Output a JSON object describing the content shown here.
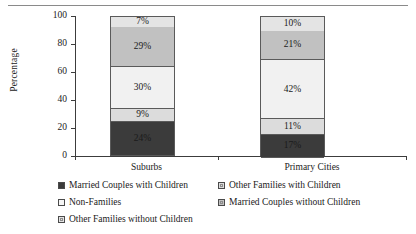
{
  "chart_data": {
    "type": "bar",
    "stacked": true,
    "stack_mode": "percent",
    "title": "",
    "subtitle": "",
    "xlabel": "",
    "ylabel": "Percentage",
    "categories": [
      "Suburbs",
      "Primary Cities"
    ],
    "ylim": [
      0,
      100
    ],
    "yticks": [
      0,
      20,
      40,
      60,
      80,
      100
    ],
    "ytick_labels": [
      "0",
      "20",
      "40",
      "60",
      "80",
      "100"
    ],
    "grid": false,
    "legend_position": "bottom",
    "series": [
      {
        "name": "Married Couples with Children",
        "color": "#3b3b3b",
        "values": [
          24,
          17
        ],
        "labels": [
          "24%",
          "17%"
        ]
      },
      {
        "name": "Other Families with Children",
        "color": "#dcdcdc",
        "values": [
          9,
          11
        ],
        "labels": [
          "9%",
          "11%"
        ]
      },
      {
        "name": "Non-Families",
        "color": "#f1f1f1",
        "values": [
          30,
          42
        ],
        "labels": [
          "30%",
          "42%"
        ]
      },
      {
        "name": "Married Couples without Children",
        "color": "#c1c1c1",
        "values": [
          29,
          21
        ],
        "labels": [
          "29%",
          "21%"
        ]
      },
      {
        "name": "Other Families without Children",
        "color": "#e4e4e4",
        "values": [
          7,
          10
        ],
        "labels": [
          "7%",
          "10%"
        ]
      }
    ]
  },
  "legend": {
    "items": [
      {
        "label": "Married Couples with Children",
        "swatch": "#3b3b3b",
        "inner": false
      },
      {
        "label": "Other Families with Children",
        "swatch": "#dcdcdc",
        "inner": true
      },
      {
        "label": "Non-Families",
        "swatch": "#f6f6f6",
        "inner": false
      },
      {
        "label": "Married Couples without Children",
        "swatch": "#c1c1c1",
        "inner": true
      },
      {
        "label": "Other Families without Children",
        "swatch": "#e4e4e4",
        "inner": true
      }
    ]
  }
}
